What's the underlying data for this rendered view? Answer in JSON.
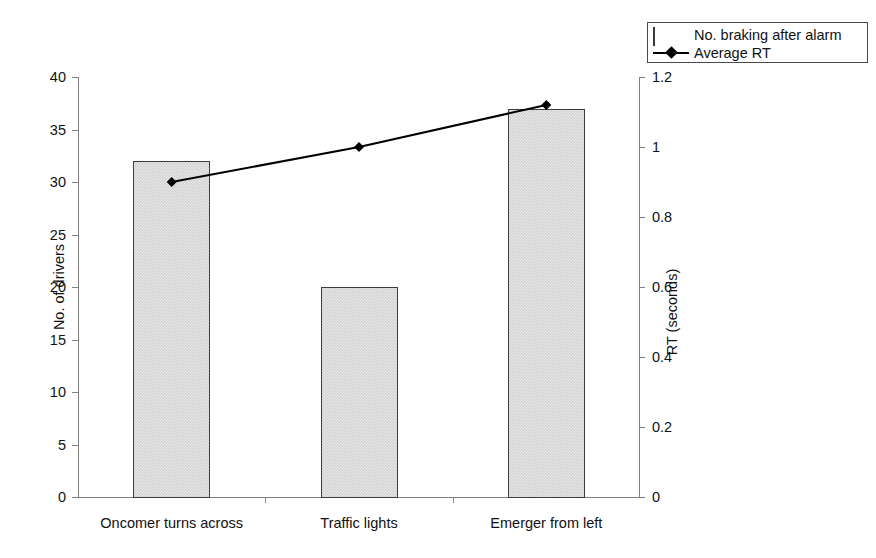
{
  "chart_data": {
    "type": "bar",
    "title": "",
    "subtitle": "",
    "categories": [
      "Oncomer turns across",
      "Traffic lights",
      "Emerger from left"
    ],
    "series": [
      {
        "name": "No. braking after alarm",
        "type": "bar",
        "axis": "left",
        "values": [
          32,
          20,
          37
        ]
      },
      {
        "name": "Average RT",
        "type": "line",
        "axis": "right",
        "marker": "diamond",
        "values": [
          0.9,
          1.0,
          1.12
        ]
      }
    ],
    "xlabel": "",
    "ylabel": "No. of drivers",
    "y2label": "RT (seconds)",
    "ylim": [
      0,
      40
    ],
    "y2lim": [
      0,
      1.2
    ],
    "yticks": [
      "0",
      "5",
      "10",
      "15",
      "20",
      "25",
      "30",
      "35",
      "40"
    ],
    "y2ticks": [
      "0",
      "0.2",
      "0.4",
      "0.6",
      "0.8",
      "1",
      "1.2"
    ],
    "grid": false,
    "legend_position": "top-right"
  },
  "legend": {
    "items": [
      {
        "label": "No. braking after alarm",
        "key": "swatch-bar",
        "color": "#d2d2d2"
      },
      {
        "label": "Average RT",
        "key": "line-diamond",
        "color": "#000000"
      }
    ]
  },
  "axes": {
    "left": {
      "title": "No. of drivers",
      "ticks": [
        "40",
        "35",
        "30",
        "25",
        "20",
        "15",
        "10",
        "5",
        "0"
      ]
    },
    "right": {
      "title": "RT (seconds)",
      "ticks": [
        "1.2",
        "1",
        "0.8",
        "0.6",
        "0.4",
        "0.2",
        "0"
      ]
    },
    "bottom": {
      "categories": [
        "Oncomer turns across",
        "Traffic lights",
        "Emerger from left"
      ]
    }
  },
  "colors": {
    "bar_fill": "#d2d2d2",
    "bar_border": "#3d3d3d",
    "line": "#000000",
    "axis": "#808080",
    "text": "#111111",
    "background": "#ffffff"
  }
}
